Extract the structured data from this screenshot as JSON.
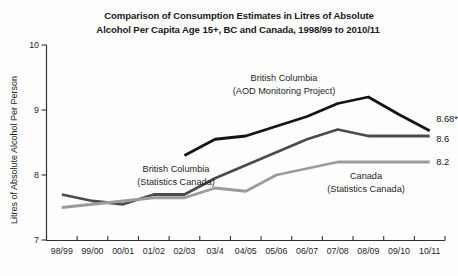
{
  "title": {
    "line1": "Comparison of Consumption Estimates in Litres of Absolute",
    "line2": "Alcohol Per Capita Age 15+, BC and Canada, 1998/99 to 2010/11"
  },
  "chart_data": {
    "type": "line",
    "title": "Comparison of Consumption Estimates in Litres of Absolute Alcohol Per Capita Age 15+, BC and Canada, 1998/99 to 2010/11",
    "xlabel": "",
    "ylabel": "Litres of Absolute Alcohol Per Person",
    "ylim": [
      7,
      10
    ],
    "yticks": [
      7,
      8,
      9,
      10
    ],
    "grid": false,
    "legend_position": "inline-annotations",
    "categories": [
      "98/99",
      "99/00",
      "00/01",
      "01/02",
      "02/03",
      "03/4",
      "04/05",
      "05/06",
      "06/07",
      "07/08",
      "08/09",
      "09/10",
      "10/11"
    ],
    "series": [
      {
        "name": "British Columbia (AOD Monitoring Project)",
        "color": "#141414",
        "values": [
          null,
          null,
          null,
          null,
          8.3,
          8.55,
          8.6,
          8.75,
          8.9,
          9.1,
          9.2,
          8.93,
          8.68
        ],
        "end_label": "8.68*",
        "end_label_dy": -9
      },
      {
        "name": "British Columbia (Statistics Canada)",
        "color": "#4c4c4c",
        "values": [
          7.7,
          7.6,
          7.55,
          7.7,
          7.7,
          7.95,
          8.15,
          8.35,
          8.55,
          8.7,
          8.6,
          8.6,
          8.6
        ],
        "end_label": "8.6",
        "end_label_dy": 6
      },
      {
        "name": "Canada (Statistics Canada)",
        "color": "#9b9b9b",
        "values": [
          7.5,
          7.55,
          7.6,
          7.65,
          7.65,
          7.8,
          7.75,
          8.0,
          8.1,
          8.2,
          8.2,
          8.2,
          8.2
        ],
        "end_label": "8.2",
        "end_label_dy": 3
      }
    ],
    "annotations": [
      {
        "lines": [
          "British Columbia",
          "(AOD Monitoring Project)"
        ],
        "x": 284,
        "y": 81
      },
      {
        "lines": [
          "British Columbia",
          "(Statistics Canada)"
        ],
        "x": 176,
        "y": 172
      },
      {
        "lines": [
          "Canada",
          "(Statistics Canada)"
        ],
        "x": 366,
        "y": 179
      }
    ]
  }
}
